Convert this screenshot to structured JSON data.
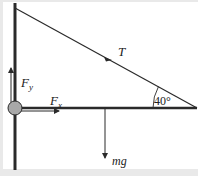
{
  "diagram": {
    "type": "free-body diagram",
    "labels": {
      "tension": "T",
      "angle": "40°",
      "fx_main": "F",
      "fx_sub": "x",
      "fy_main": "F",
      "fy_sub": "y",
      "weight": "mg"
    },
    "colors": {
      "background": "#ffffff",
      "frame": "#e9e9e9",
      "line": "#2a2a2a",
      "pivot_fill": "#a8a8a8"
    }
  }
}
